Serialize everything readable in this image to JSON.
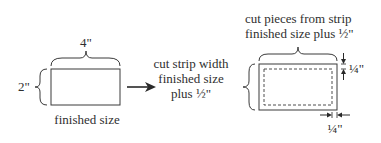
{
  "diagram": {
    "finished": {
      "width_label": "4\"",
      "height_label": "2\"",
      "caption": "finished size"
    },
    "strip_width_note": {
      "lines": [
        "cut strip width",
        "finished size",
        "plus ½\""
      ]
    },
    "pieces_note": {
      "lines": [
        "cut pieces from strip",
        "finished size plus ½\""
      ]
    },
    "seam_allowance": {
      "top_label": "¼\"",
      "side_label": "¼\""
    },
    "colors": {
      "line": "#3a3a3a",
      "background": "#ffffff"
    }
  }
}
